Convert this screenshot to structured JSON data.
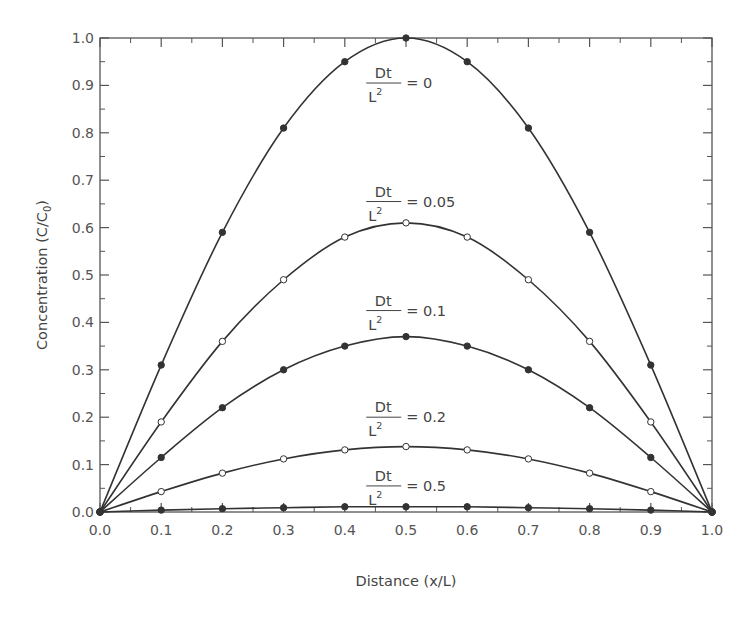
{
  "chart_data": {
    "type": "line",
    "title": "",
    "xlabel": "Distance (x/L)",
    "ylabel": "Concentration (C/C0)",
    "ylabel_parts": {
      "main": "Concentration (C/C",
      "sub": "0",
      "close": ")"
    },
    "xlim": [
      0.0,
      1.0
    ],
    "ylim": [
      0.0,
      1.0
    ],
    "grid": false,
    "legend": "none (inline annotations)",
    "x_ticks": [
      "0.0",
      "0.1",
      "0.2",
      "0.3",
      "0.4",
      "0.5",
      "0.6",
      "0.7",
      "0.8",
      "0.9",
      "1.0"
    ],
    "y_ticks": [
      "0.0",
      "0.1",
      "0.2",
      "0.3",
      "0.4",
      "0.5",
      "0.6",
      "0.7",
      "0.8",
      "0.9",
      "1.0"
    ],
    "x": [
      0.0,
      0.1,
      0.2,
      0.3,
      0.4,
      0.5,
      0.6,
      0.7,
      0.8,
      0.9,
      1.0
    ],
    "series": [
      {
        "name": "Dt/L^2 = 0",
        "marker": "filled",
        "values": [
          0.0,
          0.31,
          0.59,
          0.81,
          0.95,
          1.0,
          0.95,
          0.81,
          0.59,
          0.31,
          0.0
        ]
      },
      {
        "name": "Dt/L^2 = 0.05",
        "marker": "open",
        "values": [
          0.0,
          0.19,
          0.36,
          0.49,
          0.58,
          0.61,
          0.58,
          0.49,
          0.36,
          0.19,
          0.0
        ]
      },
      {
        "name": "Dt/L^2 = 0.1",
        "marker": "filled",
        "values": [
          0.0,
          0.115,
          0.22,
          0.3,
          0.35,
          0.37,
          0.35,
          0.3,
          0.22,
          0.115,
          0.0
        ]
      },
      {
        "name": "Dt/L^2 = 0.2",
        "marker": "open",
        "values": [
          0.0,
          0.043,
          0.082,
          0.112,
          0.131,
          0.138,
          0.131,
          0.112,
          0.082,
          0.043,
          0.0
        ]
      },
      {
        "name": "Dt/L^2 = 0.5",
        "marker": "filled",
        "values": [
          0.0,
          0.004,
          0.007,
          0.009,
          0.011,
          0.011,
          0.011,
          0.009,
          0.007,
          0.004,
          0.0
        ]
      }
    ],
    "annotations": [
      {
        "num": "Dt",
        "den": "L",
        "sup": "2",
        "eq": "= 0",
        "x": 0.435,
        "y": 0.905
      },
      {
        "num": "Dt",
        "den": "L",
        "sup": "2",
        "eq": "= 0.05",
        "x": 0.435,
        "y": 0.655
      },
      {
        "num": "Dt",
        "den": "L",
        "sup": "2",
        "eq": "= 0.1",
        "x": 0.435,
        "y": 0.425
      },
      {
        "num": "Dt",
        "den": "L",
        "sup": "2",
        "eq": "= 0.2",
        "x": 0.435,
        "y": 0.2
      },
      {
        "num": "Dt",
        "den": "L",
        "sup": "2",
        "eq": "= 0.5",
        "x": 0.435,
        "y": 0.055
      }
    ],
    "colors": {
      "line": "#333333",
      "axis": "#555555",
      "text": "#444444"
    }
  }
}
